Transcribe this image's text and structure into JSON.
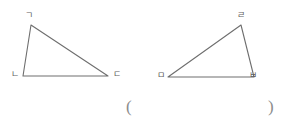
{
  "figure": {
    "background_color": "#ffffff",
    "stroke_color": "#6e6e6e",
    "label_color": "#5f5f5f",
    "triangles": [
      {
        "name": "left-triangle",
        "vertices": [
          {
            "label": "ㄱ",
            "role": "apex",
            "x": 31,
            "y": 25
          },
          {
            "label": "ㄴ",
            "role": "bottom-left",
            "x": 23,
            "y": 76
          },
          {
            "label": "ㄷ",
            "role": "bottom-right",
            "x": 108,
            "y": 76
          }
        ],
        "label_positions": [
          {
            "x": 25,
            "y": 11
          },
          {
            "x": 11,
            "y": 70
          },
          {
            "x": 113,
            "y": 70
          }
        ]
      },
      {
        "name": "right-triangle",
        "vertices": [
          {
            "label": "ㄹ",
            "role": "apex",
            "x": 241,
            "y": 25
          },
          {
            "label": "ㅁ",
            "role": "bottom-left",
            "x": 168,
            "y": 77
          },
          {
            "label": "ㅂ",
            "role": "bottom-right",
            "x": 254,
            "y": 77
          }
        ],
        "label_positions": [
          {
            "x": 237,
            "y": 11
          },
          {
            "x": 157,
            "y": 71
          },
          {
            "x": 249,
            "y": 71
          }
        ]
      }
    ],
    "answer_field": {
      "open_paren": "(",
      "close_paren": ")",
      "open_x": 126,
      "close_x": 268,
      "y": 98,
      "value": ""
    }
  }
}
